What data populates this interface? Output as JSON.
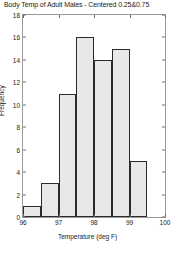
{
  "chart_data": {
    "type": "bar",
    "title": "Body Temp of Adult Males - Centered 0.25&0.75",
    "xlabel": "Temperature (deg F)",
    "ylabel": "Frequency",
    "grid": false,
    "legend": null,
    "xlim": [
      96,
      100
    ],
    "ylim": [
      0,
      18
    ],
    "bin_width": 0.5,
    "bin_edges": [
      96.0,
      96.5,
      97.0,
      97.5,
      98.0,
      98.5,
      99.0,
      99.5
    ],
    "categories": [
      "96.0-96.5",
      "96.5-97.0",
      "97.0-97.5",
      "97.5-98.0",
      "98.0-98.5",
      "98.5-99.0",
      "99.0-99.5"
    ],
    "bin_centers": [
      96.25,
      96.75,
      97.25,
      97.75,
      98.25,
      98.75,
      99.25
    ],
    "values": [
      1,
      3,
      11,
      16,
      14,
      15,
      5
    ],
    "xticks": [
      96,
      97,
      98,
      99,
      100
    ],
    "xtick_labels": [
      "96",
      "97",
      "98",
      "99",
      "100"
    ],
    "yticks": [
      0,
      2,
      4,
      6,
      8,
      10,
      12,
      14,
      16,
      18
    ],
    "ytick_labels": [
      "0",
      "2",
      "4",
      "6",
      "8",
      "10",
      "12",
      "14",
      "16",
      "18"
    ],
    "bar_fill_color": "#e8e8e8",
    "bar_edge_color": "#2b2b2b",
    "axis_color": "#9a9a9a",
    "background_color": "#ffffff"
  }
}
